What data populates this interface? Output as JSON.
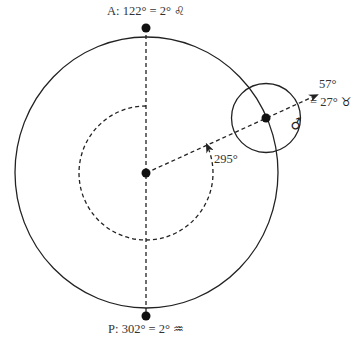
{
  "diagram": {
    "aphelion": {
      "label_prefix": "A:",
      "longitude": "122°",
      "equals": "=",
      "sign_degree": "2°",
      "sign_symbol": "♌",
      "sign_name": "Leo"
    },
    "perihelion": {
      "label_prefix": "P:",
      "longitude": "302°",
      "equals": "=",
      "sign_degree": "2°",
      "sign_symbol": "♒",
      "sign_name": "Aquarius"
    },
    "planet": {
      "symbol": "♂",
      "name": "Mars",
      "longitude": "57°",
      "sign_text": "= 27°",
      "sign_symbol": "♉",
      "sign_name": "Taurus"
    },
    "arc_angle": {
      "label": "295°",
      "degrees": 295
    }
  }
}
